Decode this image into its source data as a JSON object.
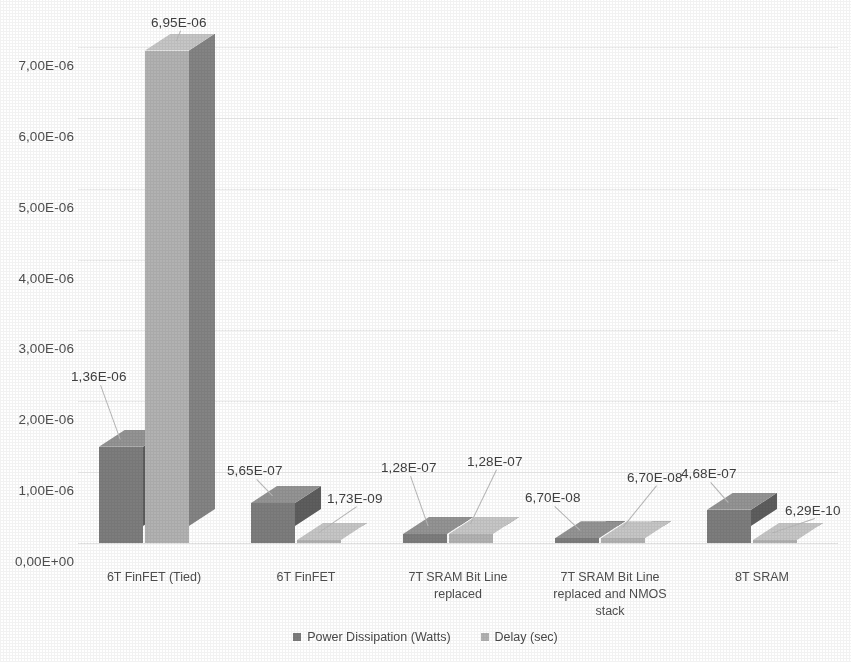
{
  "chart_data": {
    "type": "bar",
    "title": "",
    "subtitle": "",
    "xlabel": "",
    "ylabel": "",
    "grid": true,
    "legend_position": "bottom",
    "style": "3d-clustered-column",
    "decimal_separator": "comma",
    "ylim": [
      0,
      7e-06
    ],
    "ytick_step": 1e-06,
    "ytick_labels": [
      "0,00E+00",
      "1,00E-06",
      "2,00E-06",
      "3,00E-06",
      "4,00E-06",
      "5,00E-06",
      "6,00E-06",
      "7,00E-06"
    ],
    "ytick_values": [
      0,
      1e-06,
      2e-06,
      3e-06,
      4e-06,
      5e-06,
      6e-06,
      7e-06
    ],
    "categories": [
      "6T FinFET (Tied)",
      "6T FinFET",
      "7T SRAM Bit Line\nreplaced",
      "7T SRAM Bit Line\nreplaced and NMOS\nstack",
      "8T SRAM"
    ],
    "series": [
      {
        "name": "Power Dissipation (Watts)",
        "color": "#7d7d7d",
        "side_color": "#5e5e5e",
        "top_color": "#949494",
        "values": [
          1.36e-06,
          5.65e-07,
          1.28e-07,
          6.7e-08,
          4.68e-07
        ],
        "labels": [
          "1,36E-06",
          "5,65E-07",
          "1,28E-07",
          "6,70E-08",
          "4,68E-07"
        ]
      },
      {
        "name": "Delay (sec)",
        "color": "#b2b2b2",
        "side_color": "#848484",
        "top_color": "#c6c6c6",
        "values": [
          6.95e-06,
          1.73e-09,
          1.28e-07,
          6.7e-08,
          6.29e-10
        ],
        "labels": [
          "6,95E-06",
          "1,73E-09",
          "1,28E-07",
          "6,70E-08",
          "6,29E-10"
        ]
      }
    ]
  },
  "legend": {
    "items": [
      {
        "label": "Power Dissipation (Watts)",
        "color": "#7d7d7d"
      },
      {
        "label": "Delay (sec)",
        "color": "#b2b2b2"
      }
    ]
  },
  "colors": {
    "background": "#ffffff",
    "gridline": "#eeeeee",
    "text": "#4a4a4a",
    "leader": "#b9b9b9"
  }
}
